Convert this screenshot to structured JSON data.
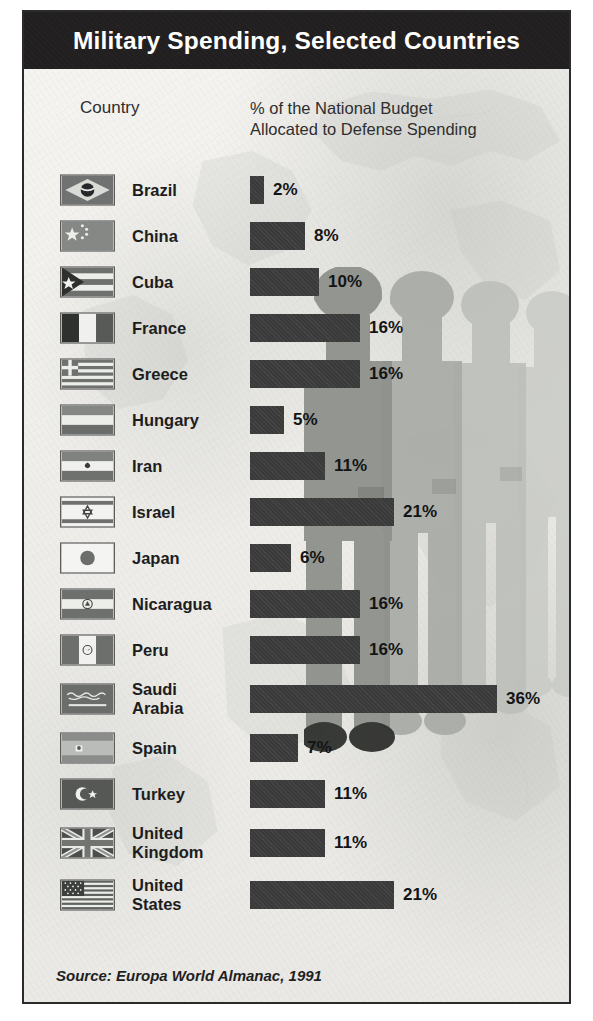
{
  "title": "Military Spending, Selected Countries",
  "headers": {
    "country": "Country",
    "metric": "% of the National Budget\nAllocated to Defense Spending"
  },
  "source": "Source: Europa World Almanac, 1991",
  "colors": {
    "title_bar": "#211f1f",
    "title_text": "#ffffff",
    "bar": "#3b3a3a",
    "panel_background": "#f2f1ee",
    "border": "#2b2b2b",
    "label_text": "#1d1d1d"
  },
  "chart_data": {
    "type": "bar",
    "title": "Military Spending, Selected Countries",
    "xlabel": "% of the National Budget Allocated to Defense Spending",
    "ylabel": "Country",
    "orientation": "horizontal",
    "xlim": [
      0,
      36
    ],
    "grid": false,
    "legend": null,
    "unit": "%",
    "source": "Europa World Almanac, 1991",
    "categories": [
      "Brazil",
      "China",
      "Cuba",
      "France",
      "Greece",
      "Hungary",
      "Iran",
      "Israel",
      "Japan",
      "Nicaragua",
      "Peru",
      "Saudi Arabia",
      "Spain",
      "Turkey",
      "United Kingdom",
      "United States"
    ],
    "values": [
      2,
      8,
      10,
      16,
      16,
      5,
      11,
      21,
      6,
      16,
      16,
      36,
      7,
      11,
      11,
      21
    ],
    "value_labels": [
      "2%",
      "8%",
      "10%",
      "16%",
      "16%",
      "5%",
      "11%",
      "21%",
      "6%",
      "16%",
      "16%",
      "36%",
      "7%",
      "11%",
      "11%",
      "21%"
    ]
  },
  "rows": [
    {
      "country": "Brazil",
      "flag": "flag-brazil",
      "value": 2,
      "label": "2%"
    },
    {
      "country": "China",
      "flag": "flag-china",
      "value": 8,
      "label": "8%"
    },
    {
      "country": "Cuba",
      "flag": "flag-cuba",
      "value": 10,
      "label": "10%"
    },
    {
      "country": "France",
      "flag": "flag-france",
      "value": 16,
      "label": "16%"
    },
    {
      "country": "Greece",
      "flag": "flag-greece",
      "value": 16,
      "label": "16%"
    },
    {
      "country": "Hungary",
      "flag": "flag-hungary",
      "value": 5,
      "label": "5%"
    },
    {
      "country": "Iran",
      "flag": "flag-iran",
      "value": 11,
      "label": "11%"
    },
    {
      "country": "Israel",
      "flag": "flag-israel",
      "value": 21,
      "label": "21%"
    },
    {
      "country": "Japan",
      "flag": "flag-japan",
      "value": 6,
      "label": "6%"
    },
    {
      "country": "Nicaragua",
      "flag": "flag-nicaragua",
      "value": 16,
      "label": "16%"
    },
    {
      "country": "Peru",
      "flag": "flag-peru",
      "value": 16,
      "label": "16%"
    },
    {
      "country": "Saudi\nArabia",
      "flag": "flag-saudi-arabia",
      "value": 36,
      "label": "36%"
    },
    {
      "country": "Spain",
      "flag": "flag-spain",
      "value": 7,
      "label": "7%"
    },
    {
      "country": "Turkey",
      "flag": "flag-turkey",
      "value": 11,
      "label": "11%"
    },
    {
      "country": "United\nKingdom",
      "flag": "flag-united-kingdom",
      "value": 11,
      "label": "11%"
    },
    {
      "country": "United\nStates",
      "flag": "flag-united-states",
      "value": 21,
      "label": "21%"
    }
  ]
}
